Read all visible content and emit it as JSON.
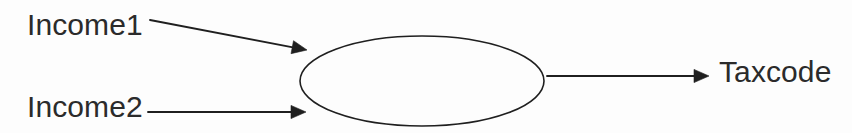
{
  "diagram": {
    "background_color": "#fdfdfd",
    "stroke_color": "#1f1f1f",
    "text_color": "#2b2b2b",
    "process": {
      "shape": "ellipse",
      "label": "",
      "center_x": 422,
      "center_y": 81,
      "rx": 122,
      "ry": 45
    },
    "inputs": [
      {
        "id": "income1",
        "label": "Income1",
        "arrow": {
          "from_x": 150,
          "from_y": 20,
          "to_x": 307,
          "to_y": 50,
          "style": "solid",
          "head": "filled-triangle"
        }
      },
      {
        "id": "income2",
        "label": "Income2",
        "arrow": {
          "from_x": 148,
          "from_y": 112,
          "to_x": 306,
          "to_y": 112,
          "style": "solid",
          "head": "filled-triangle"
        }
      }
    ],
    "outputs": [
      {
        "id": "taxcode",
        "label": "Taxcode",
        "arrow": {
          "from_x": 547,
          "from_y": 76,
          "to_x": 709,
          "to_y": 76,
          "style": "solid",
          "head": "filled-triangle"
        }
      }
    ]
  }
}
